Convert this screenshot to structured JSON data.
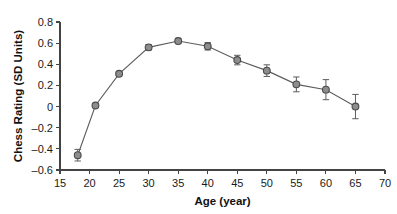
{
  "chart_data": {
    "type": "line",
    "title": "",
    "xlabel": "Age (year)",
    "ylabel": "Chess Rating (SD Units)",
    "xlim": [
      15,
      70
    ],
    "ylim": [
      -0.6,
      0.8
    ],
    "xticks": [
      15,
      20,
      25,
      30,
      35,
      40,
      45,
      50,
      55,
      60,
      65,
      70
    ],
    "yticks": [
      -0.6,
      -0.4,
      -0.2,
      0,
      0.2,
      0.4,
      0.6,
      0.8
    ],
    "xtick_labels": [
      "15",
      "20",
      "25",
      "30",
      "35",
      "40",
      "45",
      "50",
      "55",
      "60",
      "65",
      "70"
    ],
    "ytick_labels": [
      "–0.6",
      "–0.4",
      "–0.2",
      "0",
      "0.2",
      "0.4",
      "0.6",
      "0.8"
    ],
    "grid": false,
    "legend": false,
    "marker": "circle",
    "marker_color": "#8d8d8d",
    "line_color": "#5c5c5c",
    "x": [
      18,
      21,
      25,
      30,
      35,
      40,
      45,
      50,
      55,
      60,
      65
    ],
    "values": [
      -0.46,
      0.01,
      0.31,
      0.56,
      0.62,
      0.57,
      0.44,
      0.34,
      0.21,
      0.16,
      0.0
    ],
    "error": [
      0.055,
      0.015,
      0.02,
      0.025,
      0.025,
      0.035,
      0.045,
      0.055,
      0.07,
      0.095,
      0.115
    ],
    "series": [
      {
        "name": "Chess Rating",
        "x": [
          18,
          21,
          25,
          30,
          35,
          40,
          45,
          50,
          55,
          60,
          65
        ],
        "values": [
          -0.46,
          0.01,
          0.31,
          0.56,
          0.62,
          0.57,
          0.44,
          0.34,
          0.21,
          0.16,
          0.0
        ],
        "error": [
          0.055,
          0.015,
          0.02,
          0.025,
          0.025,
          0.035,
          0.045,
          0.055,
          0.07,
          0.095,
          0.115
        ]
      }
    ]
  }
}
